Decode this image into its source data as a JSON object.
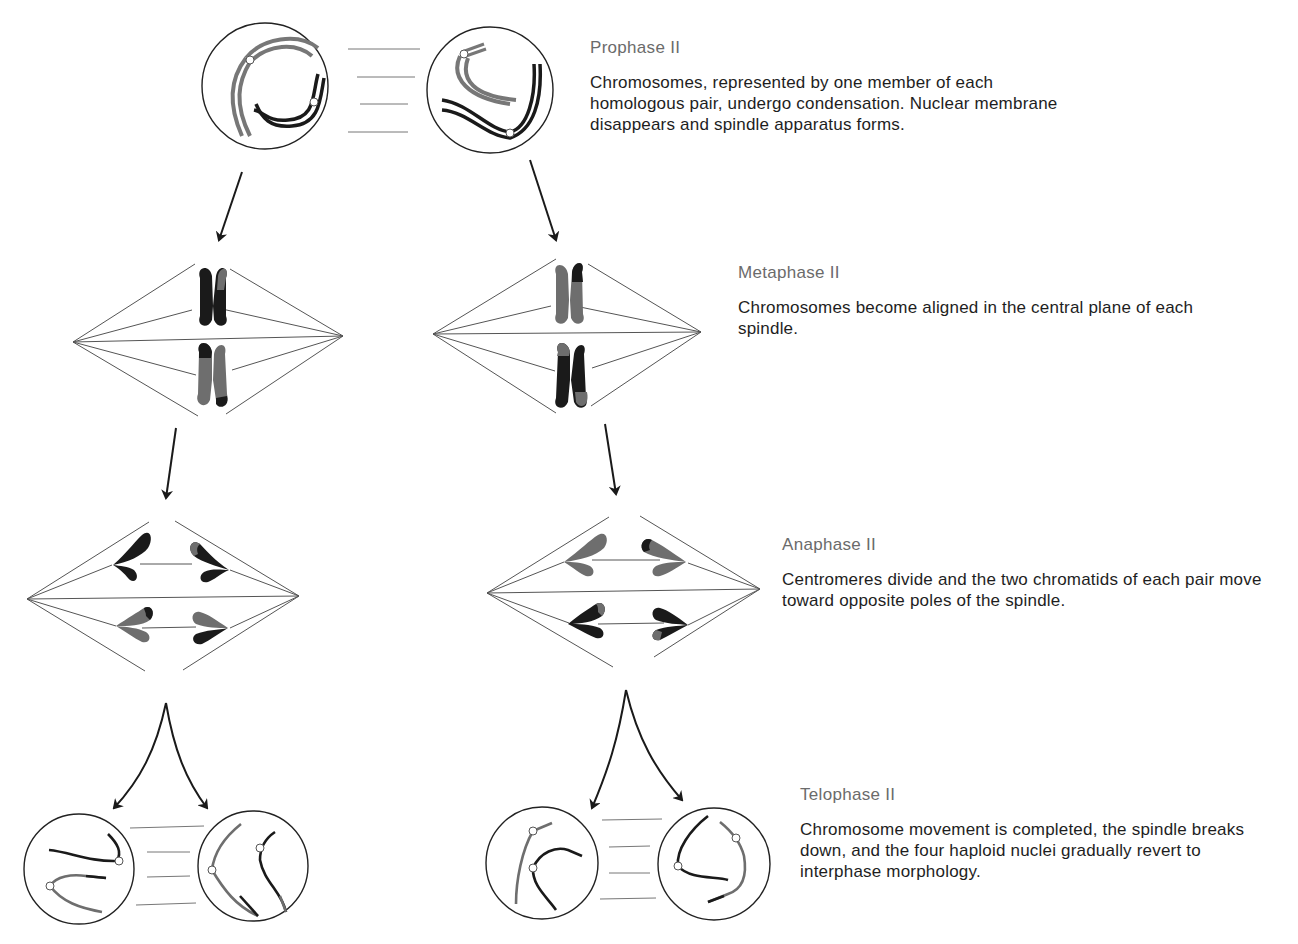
{
  "diagram": {
    "colors": {
      "dark_chromatid": "#1a1a1a",
      "light_chromatid": "#6e6e6e",
      "spindle_line": "#555555",
      "outline": "#222222"
    },
    "stages": [
      {
        "id": "prophase-ii",
        "title": "Prophase II",
        "description": "Chromosomes, represented by one member of each homologous pair, undergo condensation. Nuclear membrane disappears and spindle apparatus forms."
      },
      {
        "id": "metaphase-ii",
        "title": "Metaphase II",
        "description": "Chromosomes become aligned in the central plane of each spindle."
      },
      {
        "id": "anaphase-ii",
        "title": "Anaphase II",
        "description": "Centromeres divide and the two chromatids of each pair move toward opposite poles of the spindle."
      },
      {
        "id": "telophase-ii",
        "title": "Telophase II",
        "description": "Chromosome movement is completed, the spindle breaks down, and the four haploid nuclei gradually revert to interphase morphology."
      }
    ]
  }
}
